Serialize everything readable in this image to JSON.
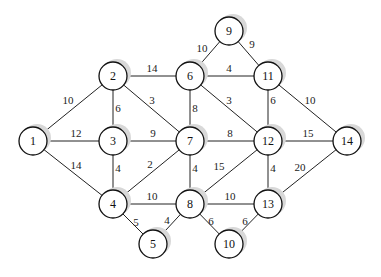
{
  "diagram": {
    "type": "weighted-undirected-graph",
    "node_radius": 14,
    "nodes": [
      {
        "id": "1",
        "label": "1",
        "x": 33,
        "y": 141
      },
      {
        "id": "2",
        "label": "2",
        "x": 113,
        "y": 76
      },
      {
        "id": "3",
        "label": "3",
        "x": 113,
        "y": 141
      },
      {
        "id": "4",
        "label": "4",
        "x": 113,
        "y": 204
      },
      {
        "id": "5",
        "label": "5",
        "x": 153,
        "y": 244
      },
      {
        "id": "6",
        "label": "6",
        "x": 190,
        "y": 76
      },
      {
        "id": "7",
        "label": "7",
        "x": 190,
        "y": 141
      },
      {
        "id": "8",
        "label": "8",
        "x": 190,
        "y": 204
      },
      {
        "id": "9",
        "label": "9",
        "x": 229,
        "y": 31
      },
      {
        "id": "10",
        "label": "10",
        "x": 229,
        "y": 244
      },
      {
        "id": "11",
        "label": "11",
        "x": 268,
        "y": 76
      },
      {
        "id": "12",
        "label": "12",
        "x": 268,
        "y": 141
      },
      {
        "id": "13",
        "label": "13",
        "x": 268,
        "y": 204
      },
      {
        "id": "14",
        "label": "14",
        "x": 347,
        "y": 141
      }
    ],
    "edges": [
      {
        "from": "1",
        "to": "2",
        "weight": "10",
        "lx": 68,
        "ly": 104
      },
      {
        "from": "1",
        "to": "3",
        "weight": "12",
        "lx": 76,
        "ly": 137
      },
      {
        "from": "1",
        "to": "4",
        "weight": "14",
        "lx": 76,
        "ly": 169
      },
      {
        "from": "2",
        "to": "3",
        "weight": "6",
        "lx": 118,
        "ly": 112
      },
      {
        "from": "2",
        "to": "6",
        "weight": "14",
        "lx": 152,
        "ly": 72
      },
      {
        "from": "2",
        "to": "7",
        "weight": "3",
        "lx": 152,
        "ly": 104
      },
      {
        "from": "3",
        "to": "7",
        "weight": "9",
        "lx": 153,
        "ly": 137
      },
      {
        "from": "3",
        "to": "4",
        "weight": "4",
        "lx": 118,
        "ly": 172
      },
      {
        "from": "4",
        "to": "7",
        "weight": "2",
        "lx": 150,
        "ly": 168
      },
      {
        "from": "4",
        "to": "8",
        "weight": "10",
        "lx": 152,
        "ly": 200
      },
      {
        "from": "4",
        "to": "5",
        "weight": "5",
        "lx": 136,
        "ly": 226
      },
      {
        "from": "5",
        "to": "8",
        "weight": "4",
        "lx": 167,
        "ly": 224
      },
      {
        "from": "6",
        "to": "9",
        "weight": "10",
        "lx": 202,
        "ly": 52
      },
      {
        "from": "6",
        "to": "11",
        "weight": "4",
        "lx": 229,
        "ly": 72
      },
      {
        "from": "6",
        "to": "7",
        "weight": "8",
        "lx": 195,
        "ly": 112
      },
      {
        "from": "6",
        "to": "12",
        "weight": "3",
        "lx": 229,
        "ly": 104
      },
      {
        "from": "9",
        "to": "11",
        "weight": "9",
        "lx": 252,
        "ly": 48
      },
      {
        "from": "7",
        "to": "12",
        "weight": "8",
        "lx": 230,
        "ly": 137
      },
      {
        "from": "7",
        "to": "8",
        "weight": "4",
        "lx": 195,
        "ly": 172
      },
      {
        "from": "8",
        "to": "12",
        "weight": "15",
        "lx": 219,
        "ly": 170
      },
      {
        "from": "8",
        "to": "13",
        "weight": "10",
        "lx": 230,
        "ly": 200
      },
      {
        "from": "8",
        "to": "10",
        "weight": "6",
        "lx": 211,
        "ly": 225
      },
      {
        "from": "10",
        "to": "13",
        "weight": "6",
        "lx": 245,
        "ly": 225
      },
      {
        "from": "11",
        "to": "12",
        "weight": "6",
        "lx": 273,
        "ly": 104
      },
      {
        "from": "11",
        "to": "14",
        "weight": "10",
        "lx": 310,
        "ly": 104
      },
      {
        "from": "12",
        "to": "14",
        "weight": "15",
        "lx": 308,
        "ly": 137
      },
      {
        "from": "12",
        "to": "13",
        "weight": "4",
        "lx": 273,
        "ly": 172
      },
      {
        "from": "13",
        "to": "14",
        "weight": "20",
        "lx": 300,
        "ly": 171
      }
    ]
  }
}
